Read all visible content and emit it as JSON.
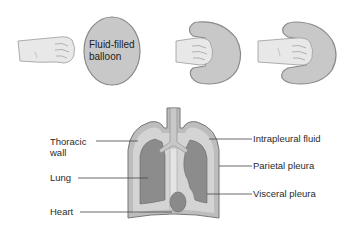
{
  "top_panel": {
    "balloon_label_line1": "Fluid-filled",
    "balloon_label_line2": "balloon"
  },
  "bottom_panel": {
    "labels": {
      "thoracic_wall_line1": "Thoracic",
      "thoracic_wall_line2": "wall",
      "lung": "Lung",
      "heart": "Heart",
      "intrapleural_fluid": "Intrapleural fluid",
      "parietal_pleura": "Parietal pleura",
      "visceral_pleura": "Visceral pleura"
    }
  },
  "colors": {
    "balloon_fill": "#c8c8c8",
    "balloon_stroke": "#8a8a8a",
    "fist_fill": "#e6e6e6",
    "lung_fill": "#8c8c8c",
    "pleural_fluid_fill": "#d2d2d2",
    "chest_wall_fill": "#bdbdbd",
    "heart_fill": "#8a8a8a"
  }
}
